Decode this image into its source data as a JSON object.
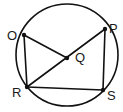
{
  "diagram": {
    "type": "circle-geometry",
    "colors": {
      "stroke": "#111111",
      "background": "#ffffff",
      "label": "#1a1a1a"
    },
    "circle": {
      "cx": 67,
      "cy": 55,
      "r": 51
    },
    "points": [
      {
        "id": "O",
        "label": "O",
        "x": 24,
        "y": 35,
        "label_x": 7,
        "label_y": 40
      },
      {
        "id": "P",
        "label": "P",
        "x": 105,
        "y": 29,
        "label_x": 109,
        "label_y": 33
      },
      {
        "id": "Q",
        "label": "Q",
        "x": 67,
        "y": 58,
        "label_x": 75,
        "label_y": 62
      },
      {
        "id": "R",
        "label": "R",
        "x": 27,
        "y": 87,
        "label_x": 12,
        "label_y": 97
      },
      {
        "id": "S",
        "label": "S",
        "x": 103,
        "y": 90,
        "label_x": 107,
        "label_y": 100
      }
    ],
    "segments": [
      {
        "from": "O",
        "to": "Q"
      },
      {
        "from": "O",
        "to": "R"
      },
      {
        "from": "R",
        "to": "P"
      },
      {
        "from": "R",
        "to": "S"
      },
      {
        "from": "P",
        "to": "S"
      }
    ]
  }
}
